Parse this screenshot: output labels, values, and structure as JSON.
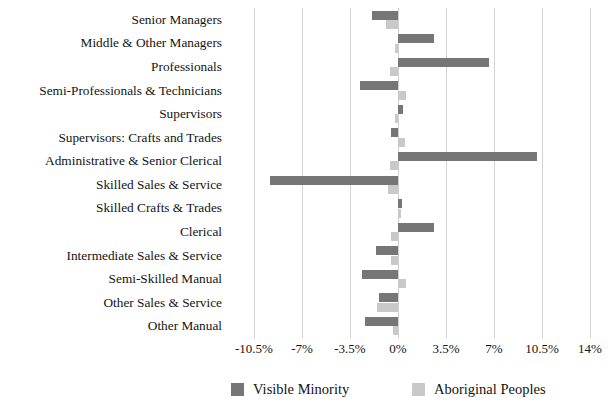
{
  "chart_data": {
    "type": "bar",
    "orientation": "horizontal",
    "title": "",
    "subtitle": "",
    "xlabel": "",
    "ylabel": "",
    "grid": true,
    "legend_position": "bottom",
    "xlim": [
      -12.25,
      14.0
    ],
    "xticks": [
      "-10.5%",
      "-7%",
      "-3.5%",
      "0%",
      "3.5%",
      "7%",
      "10.5%",
      "14%"
    ],
    "xtick_values": [
      -10.5,
      -7,
      -3.5,
      0,
      3.5,
      7,
      10.5,
      14
    ],
    "categories": [
      "Senior Managers",
      "Middle & Other Managers",
      "Professionals",
      "Semi-Professionals & Technicians",
      "Supervisors",
      "Supervisors: Crafts and Trades",
      "Administrative & Senior Clerical",
      "Skilled Sales & Service",
      "Skilled Crafts & Trades",
      "Clerical",
      "Intermediate Sales & Service",
      "Semi-Skilled Manual",
      "Other Sales & Service",
      "Other Manual"
    ],
    "series": [
      {
        "name": "Visible Minority",
        "color": "#767676",
        "values": [
          -1.9,
          2.6,
          6.6,
          -2.8,
          0.4,
          -0.5,
          10.1,
          -9.3,
          0.3,
          2.6,
          -1.6,
          -2.6,
          -1.4,
          -2.4
        ]
      },
      {
        "name": "Aboriginal Peoples",
        "color": "#c9c9c9",
        "values": [
          -0.9,
          -0.2,
          -0.6,
          0.6,
          -0.2,
          0.5,
          -0.6,
          -0.7,
          0.2,
          -0.5,
          -0.5,
          0.6,
          -1.5,
          -0.4
        ]
      }
    ]
  },
  "legend": {
    "entries": [
      {
        "label": "Visible Minority",
        "swatch": "dark-gray-swatch"
      },
      {
        "label": "Aboriginal Peoples",
        "swatch": "light-gray-swatch"
      }
    ]
  },
  "colors": {
    "visible_minority": "#767676",
    "aboriginal_peoples": "#c9c9c9",
    "gridline": "#d2d2d2",
    "text": "#131313",
    "background": "#ffffff"
  }
}
